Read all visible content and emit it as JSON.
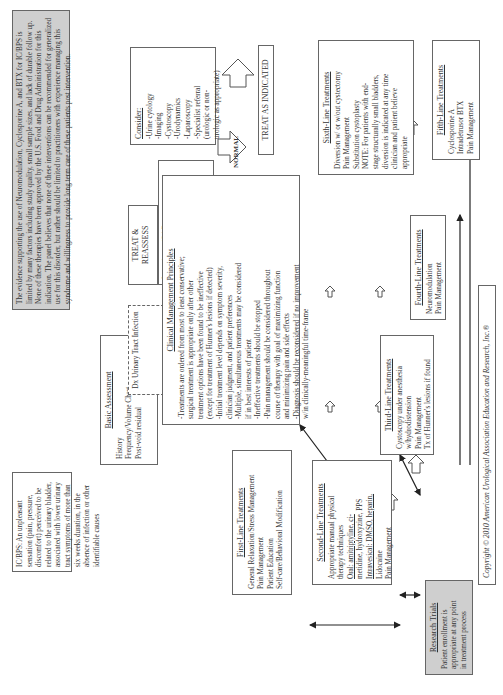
{
  "definition": {
    "text": "IC/BPS: An unpleasant sensation (pain, pressure, discomfort) perceived to be related to the urinary bladder, associated with lower urinary tract symptoms of more than six weeks duration, in the absence of infection or other identifiable causes"
  },
  "evidence_note": {
    "text": "The evidence supporting the use of Neuromodulation, Cyclosporine A, and BTX for IC/BPS is limited by many factors including study quality, small sample sizes, and lack of durable follow up. None of these therapies have been approved by the U.S. Food and Drug Administration for this indication. The panel believes that none of these interventions can be recommended for generalized use for this disorder, but rather should be limited to practitioners with experience managing this syndrome and willingness to provide long term care of these patients post intervention."
  },
  "basic_assessment": {
    "title": "Basic Assessment",
    "items": [
      "History",
      "Frequency/Volume Chart",
      "Post-void residual",
      "Physical examination",
      "Urinalysis, culture",
      "Cytology if smoking hx",
      "Symptom questionnaire",
      "Pain evaluation"
    ]
  },
  "dx_uti": {
    "text": "Dx Urinary Tract Infection"
  },
  "treat_reassess": {
    "text": "TREAT & REASSESS"
  },
  "complicated": {
    "text": "Signs/Symptoms of Complicated IC/BPS"
  },
  "complicated_signs": {
    "items": [
      "Incontinence/OAB",
      "GI signs/symptoms",
      "Microscopic/gross hema-",
      "turia/sterile pyuria",
      "Gynecologic signs/symptoms"
    ]
  },
  "consider": {
    "title": "Consider:",
    "items": [
      "-Urine cytology",
      "-Imaging",
      "-Cystoscopy",
      "-Urodynamics",
      "-Laparoscopy",
      "-Specialist referral",
      "(urologic or non-",
      "urologic as appropriate)"
    ]
  },
  "treat_as_indicated": {
    "text": "TREAT AS INDICATED"
  },
  "normal_label": "NORMAL",
  "principles": {
    "title": "Clinical Management Principles",
    "items": [
      "-Treatments are ordered from most to least conservative;",
      "surgical treatment is appropriate only after other",
      "treatment options have been found to be ineffective",
      "(except for treatment of Hunner's lesions if detected)",
      "-Initial treatment level depends on symptom severity,",
      "clinician judgment, and patient preferences",
      "-Multiple, simultaneous treatments may be considered",
      "if in best interests of patient",
      "-Ineffective treatments should be stopped",
      "-Pain management should be considered throughout",
      "course of therapy with goal of maximizing function",
      "and minimizing pain and side effects",
      "-Diagnosis should be reconsidered if no improvement",
      "w/in clinically-meaningful time-frame"
    ]
  },
  "first_line": {
    "title": "First-Line Treatments",
    "items": [
      "General Relaxation/Stress Management",
      "Pain Management",
      "Patient Education",
      "Self-care/Behavioral Modification"
    ]
  },
  "second_line": {
    "title": "Second-Line Treatments",
    "items": [
      "Appropriate manual physical",
      "therapy techniques",
      "Oral: amitriptyline, ci-",
      "metidine, hydroxyzine, PPS",
      "Intravesical: DMSO, heparin,",
      "Lidocaine",
      "Pain Management"
    ]
  },
  "third_line": {
    "title": "Third-Line Treatments",
    "items": [
      "Cystoscopy under anesthesia",
      "w/hydrodistension",
      "Pain Management",
      "Tx of Hunner's lesions if found"
    ]
  },
  "fourth_line": {
    "title": "Fourth-Line Treatments",
    "items": [
      "Neuromodulation",
      "Pain Management"
    ]
  },
  "fifth_line": {
    "title": "Fifth-Line Treatments",
    "items": [
      "Cyclosporine A",
      "Intradetrusor BTX",
      "Pain Management"
    ]
  },
  "sixth_line": {
    "title": "Sixth-Line Treatments",
    "items": [
      "Diversion w/ or w/out cystectomy",
      "Pain Management",
      "Substitution cystoplasty",
      "NOTE: For patients with end-",
      "stage structurally small bladders,",
      "diversion is indicated at any time",
      "clinician and patient believe",
      "appropriate"
    ]
  },
  "research_trials": {
    "title": "Research Trials",
    "items": [
      "Patient enrollment is",
      "appropriate at any point",
      "in treatment process"
    ]
  },
  "copyright": "Copyright © 2010 American Urological Association Education and Research, Inc.®"
}
